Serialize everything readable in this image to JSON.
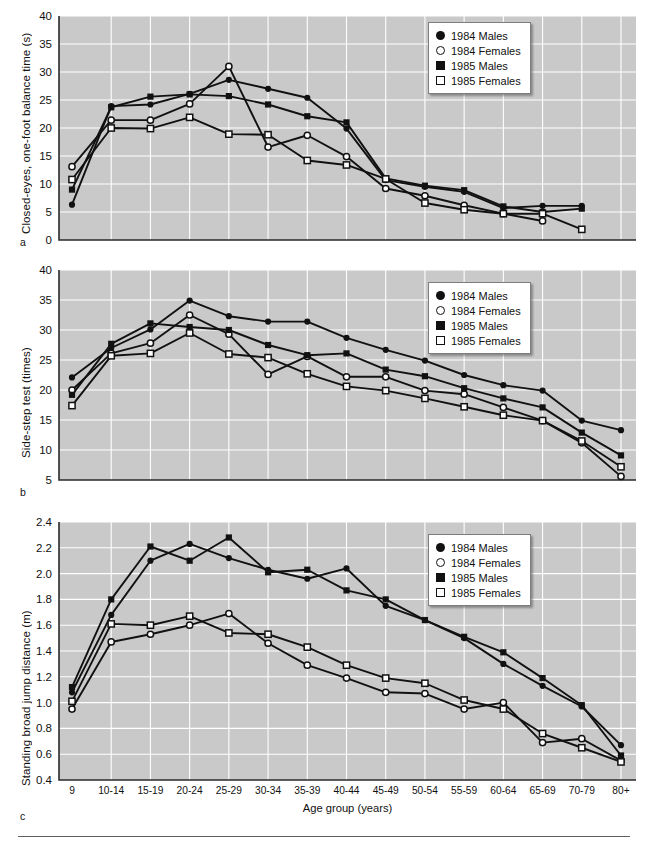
{
  "figure": {
    "xaxis_title": "Age group (years)",
    "categories": [
      "9",
      "10-14",
      "15-19",
      "20-24",
      "25-29",
      "30-34",
      "35-39",
      "40-44",
      "45-49",
      "50-54",
      "55-59",
      "60-64",
      "65-69",
      "70-79",
      "80+"
    ],
    "legend_entries": [
      {
        "label": "1984 Males",
        "marker": "filled-circle"
      },
      {
        "label": "1984 Females",
        "marker": "open-circle"
      },
      {
        "label": "1985 Males",
        "marker": "filled-square"
      },
      {
        "label": "1985 Females",
        "marker": "open-square"
      }
    ],
    "colors": {
      "plot_background": "#c9c9c9",
      "gridline": "#ffffff",
      "series": "#111111",
      "axis": "#2a2a2a"
    }
  },
  "panels": [
    {
      "letter": "a",
      "ylabel": "Closed-eyes, one-foot balance time (s)",
      "yticks": [
        "0",
        "5",
        "10",
        "15",
        "20",
        "25",
        "30",
        "35",
        "40"
      ]
    },
    {
      "letter": "b",
      "ylabel": "Side-step test (times)",
      "yticks": [
        "5",
        "10",
        "15",
        "20",
        "25",
        "30",
        "35",
        "40"
      ]
    },
    {
      "letter": "c",
      "ylabel": "Standing broad jump distance (m)",
      "yticks": [
        "0.4",
        "0.6",
        "0.8",
        "1.0",
        "1.2",
        "1.4",
        "1.6",
        "1.8",
        "2.0",
        "2.2",
        "2.4"
      ]
    }
  ],
  "chart_data": [
    {
      "id": "a",
      "type": "line",
      "title": "",
      "xlabel": "Age group (years)",
      "ylabel": "Closed-eyes, one-foot balance time (s)",
      "categories": [
        "9",
        "10-14",
        "15-19",
        "20-24",
        "25-29",
        "30-34",
        "35-39",
        "40-44",
        "45-49",
        "50-54",
        "55-59",
        "60-64",
        "65-69",
        "70-79",
        "80+"
      ],
      "ylim": [
        0,
        40
      ],
      "ytick_step": 5,
      "grid": true,
      "legend_position": "top-right",
      "series": [
        {
          "name": "1984 Males",
          "marker": "filled-circle",
          "values": [
            6.3,
            23.9,
            24.2,
            26.1,
            28.6,
            27.0,
            25.4,
            19.9,
            10.7,
            9.5,
            8.6,
            5.7,
            6.1,
            6.1,
            null
          ]
        },
        {
          "name": "1984 Females",
          "marker": "open-circle",
          "values": [
            13.1,
            21.4,
            21.4,
            24.3,
            31.0,
            16.6,
            18.7,
            14.9,
            9.2,
            7.9,
            6.2,
            4.7,
            3.4,
            null,
            null
          ]
        },
        {
          "name": "1985 Males",
          "marker": "filled-square",
          "values": [
            9.0,
            23.7,
            25.6,
            26.0,
            25.7,
            24.2,
            22.1,
            21.0,
            11.0,
            9.7,
            8.9,
            6.0,
            5.0,
            5.6,
            null
          ]
        },
        {
          "name": "1985 Females",
          "marker": "open-square",
          "values": [
            10.8,
            20.0,
            19.9,
            21.9,
            18.9,
            18.8,
            14.2,
            13.4,
            10.9,
            6.6,
            5.4,
            4.7,
            4.7,
            1.9,
            null
          ]
        }
      ],
      "note": "Series plotted across the first 14-15 age-group positions of the shared x axis."
    },
    {
      "id": "b",
      "type": "line",
      "title": "",
      "xlabel": "Age group (years)",
      "ylabel": "Side-step test (times)",
      "categories": [
        "9",
        "10-14",
        "15-19",
        "20-24",
        "25-29",
        "30-34",
        "35-39",
        "40-44",
        "45-49",
        "50-54",
        "55-59",
        "60-64",
        "65-69",
        "70-79",
        "80+"
      ],
      "ylim": [
        5,
        40
      ],
      "ytick_step": 5,
      "grid": true,
      "legend_position": "top-right",
      "series": [
        {
          "name": "1984 Males",
          "marker": "filled-circle",
          "values": [
            22.1,
            27.0,
            30.1,
            34.9,
            32.3,
            31.4,
            31.4,
            28.7,
            26.7,
            24.9,
            22.5,
            20.8,
            19.9,
            14.9,
            13.3
          ]
        },
        {
          "name": "1984 Females",
          "marker": "open-circle",
          "values": [
            20.0,
            26.1,
            27.8,
            32.5,
            29.3,
            22.6,
            25.6,
            22.2,
            22.2,
            19.9,
            19.3,
            17.1,
            14.9,
            11.2,
            5.6
          ]
        },
        {
          "name": "1985 Males",
          "marker": "filled-square",
          "values": [
            19.2,
            27.7,
            31.1,
            30.5,
            30.0,
            27.5,
            25.8,
            26.1,
            23.4,
            22.3,
            20.3,
            18.6,
            17.1,
            12.9,
            9.1
          ]
        },
        {
          "name": "1985 Females",
          "marker": "open-square",
          "values": [
            17.4,
            25.7,
            26.1,
            29.5,
            26.0,
            25.4,
            22.7,
            20.6,
            19.9,
            18.6,
            17.2,
            15.8,
            14.9,
            11.5,
            7.2
          ]
        }
      ]
    },
    {
      "id": "c",
      "type": "line",
      "title": "",
      "xlabel": "Age group (years)",
      "ylabel": "Standing broad jump distance (m)",
      "categories": [
        "9",
        "10-14",
        "15-19",
        "20-24",
        "25-29",
        "30-34",
        "35-39",
        "40-44",
        "45-49",
        "50-54",
        "55-59",
        "60-64",
        "65-69",
        "70-79",
        "80+"
      ],
      "ylim": [
        0.4,
        2.4
      ],
      "ytick_step": 0.2,
      "grid": true,
      "legend_position": "top-right",
      "series": [
        {
          "name": "1984 Males",
          "marker": "filled-circle",
          "values": [
            1.08,
            1.68,
            2.1,
            2.23,
            2.12,
            2.03,
            1.96,
            2.04,
            1.75,
            1.64,
            1.5,
            1.3,
            1.13,
            0.97,
            0.67
          ]
        },
        {
          "name": "1984 Females",
          "marker": "open-circle",
          "values": [
            0.95,
            1.47,
            1.53,
            1.6,
            1.69,
            1.46,
            1.29,
            1.19,
            1.08,
            1.07,
            0.95,
            1.0,
            0.69,
            0.72,
            0.55
          ]
        },
        {
          "name": "1985 Males",
          "marker": "filled-square",
          "values": [
            1.12,
            1.8,
            2.21,
            2.1,
            2.28,
            2.01,
            2.03,
            1.87,
            1.8,
            1.64,
            1.51,
            1.39,
            1.19,
            0.98,
            0.59
          ]
        },
        {
          "name": "1985 Females",
          "marker": "open-square",
          "values": [
            1.01,
            1.61,
            1.6,
            1.67,
            1.54,
            1.53,
            1.43,
            1.29,
            1.19,
            1.15,
            1.02,
            0.95,
            0.76,
            0.65,
            0.54
          ]
        }
      ]
    }
  ]
}
